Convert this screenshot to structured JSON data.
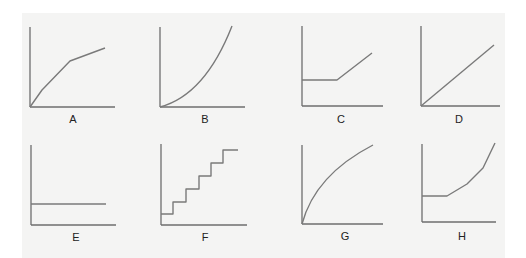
{
  "figure": {
    "colors": {
      "panel": "#f4f4f3",
      "axis": "#6e6e6e",
      "curve": "#7a7a7a",
      "label": "#222222"
    },
    "graphs": [
      {
        "label": "A",
        "shape": "piecewise concave (steep then shallower slope)",
        "origin": [
          30,
          107
        ],
        "yTop": 27,
        "xEnd": 115,
        "labelPos": [
          73,
          123
        ],
        "points": [
          [
            30,
            107
          ],
          [
            42,
            90
          ],
          [
            70,
            61
          ],
          [
            105,
            48
          ]
        ]
      },
      {
        "label": "B",
        "shape": "convex increasing curve",
        "origin": [
          160,
          107
        ],
        "yTop": 27,
        "xEnd": 245,
        "labelPos": [
          205,
          123
        ],
        "path": "M160,107 Q205,95 232,26"
      },
      {
        "label": "C",
        "shape": "flat then linear increase",
        "origin": [
          302,
          106
        ],
        "yTop": 26,
        "xEnd": 383,
        "labelPos": [
          341,
          123
        ],
        "points": [
          [
            302,
            80
          ],
          [
            337,
            80
          ],
          [
            372,
            53
          ]
        ]
      },
      {
        "label": "D",
        "shape": "linear through origin",
        "origin": [
          421,
          106
        ],
        "yTop": 26,
        "xEnd": 500,
        "labelPos": [
          459,
          123
        ],
        "points": [
          [
            421,
            106
          ],
          [
            494,
            45
          ]
        ]
      },
      {
        "label": "E",
        "shape": "constant horizontal line",
        "origin": [
          31,
          225
        ],
        "yTop": 145,
        "xEnd": 116,
        "labelPos": [
          76,
          241
        ],
        "points": [
          [
            31,
            204
          ],
          [
            106,
            204
          ]
        ]
      },
      {
        "label": "F",
        "shape": "step function",
        "origin": [
          161,
          225
        ],
        "yTop": 144,
        "xEnd": 247,
        "labelPos": [
          205,
          241
        ],
        "points": [
          [
            161,
            214
          ],
          [
            173,
            214
          ],
          [
            173,
            202
          ],
          [
            186,
            202
          ],
          [
            186,
            189
          ],
          [
            199,
            189
          ],
          [
            199,
            176
          ],
          [
            211,
            176
          ],
          [
            211,
            163
          ],
          [
            223,
            163
          ],
          [
            223,
            150
          ],
          [
            238,
            150
          ]
        ]
      },
      {
        "label": "G",
        "shape": "concave increasing curve",
        "origin": [
          302,
          224
        ],
        "yTop": 145,
        "xEnd": 383,
        "labelPos": [
          345,
          240
        ],
        "path": "M302,224 Q315,175 373,145"
      },
      {
        "label": "H",
        "shape": "flat then increasingly steep rise",
        "origin": [
          422,
          222
        ],
        "yTop": 144,
        "xEnd": 496,
        "labelPos": [
          462,
          240
        ],
        "points": [
          [
            422,
            196
          ],
          [
            447,
            196
          ],
          [
            467,
            184
          ],
          [
            483,
            168
          ],
          [
            495,
            143
          ]
        ]
      }
    ]
  }
}
